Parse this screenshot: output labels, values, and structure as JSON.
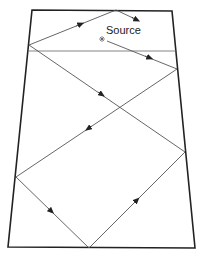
{
  "diagram": {
    "type": "ray-reflection-trapezoid",
    "source_label": "Source",
    "colors": {
      "boundary": "#222222",
      "ray": "#555555",
      "background": "#ffffff"
    },
    "boundary": {
      "top_left": [
        32,
        10
      ],
      "top_right": [
        172,
        11
      ],
      "bottom_right": [
        195,
        248
      ],
      "bottom_left": [
        8,
        247
      ]
    },
    "source_point": [
      102,
      39
    ],
    "horizontal_line": {
      "from": [
        29,
        51
      ],
      "to": [
        177,
        51
      ]
    },
    "ray_path": [
      [
        102,
        39
      ],
      [
        177,
        69
      ],
      [
        185,
        152
      ],
      [
        16,
        177
      ],
      [
        89,
        248
      ],
      [
        185,
        152
      ]
    ],
    "arrows_count": 8
  }
}
